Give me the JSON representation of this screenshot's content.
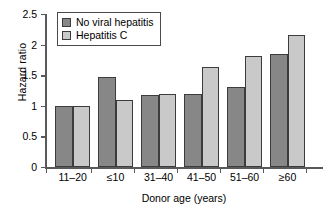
{
  "chart_data": {
    "type": "bar",
    "title": "",
    "subtitle": "",
    "xlabel": "Donor age (years)",
    "ylabel": "Hazard ratio",
    "categories": [
      "11–20",
      "≤10",
      "31–40",
      "41–50",
      "51–60",
      "≥60"
    ],
    "series": [
      {
        "name": "No viral hepatitis",
        "color": "#878787",
        "values": [
          1.0,
          1.47,
          1.17,
          1.19,
          1.3,
          1.85
        ]
      },
      {
        "name": "Hepatitis C",
        "color": "#c9c9c9",
        "values": [
          1.0,
          1.09,
          1.2,
          1.64,
          1.82,
          2.16
        ]
      }
    ],
    "ylim": [
      0,
      2.5
    ],
    "ytick_labels": [
      "0",
      "0.5",
      "1",
      "1.5",
      "2",
      "2.5"
    ],
    "ytick_values": [
      0,
      0.5,
      1,
      1.5,
      2,
      2.5
    ],
    "grid": false,
    "legend_position": "top-left-inside"
  },
  "legend": {
    "entries": [
      {
        "label": "No viral hepatitis",
        "swatch": "legend-swatch-no-viral-hepatitis"
      },
      {
        "label": "Hepatitis C",
        "swatch": "legend-swatch-hepatitis-c"
      }
    ]
  }
}
